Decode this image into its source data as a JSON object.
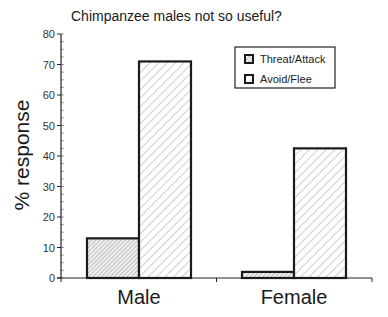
{
  "chart_data": {
    "type": "bar",
    "title": "Chimpanzee males not so useful?",
    "xlabel": "",
    "ylabel": "% response",
    "ylim": [
      0,
      80
    ],
    "yticks": [
      0,
      10,
      20,
      30,
      40,
      50,
      60,
      70,
      80
    ],
    "categories": [
      "Male",
      "Female"
    ],
    "series": [
      {
        "name": "Threat/Attack",
        "values": [
          13,
          2
        ],
        "pattern": "fine-diagonal-hatch"
      },
      {
        "name": "Avoid/Flee",
        "values": [
          71,
          42.5
        ],
        "pattern": "wide-diagonal-hatch"
      }
    ],
    "grid": false,
    "legend_position": "upper-right"
  },
  "title": "Chimpanzee males not so useful?",
  "y_axis_label": "% response",
  "legend": [
    {
      "label": "Threat/Attack"
    },
    {
      "label": "Avoid/Flee"
    }
  ]
}
